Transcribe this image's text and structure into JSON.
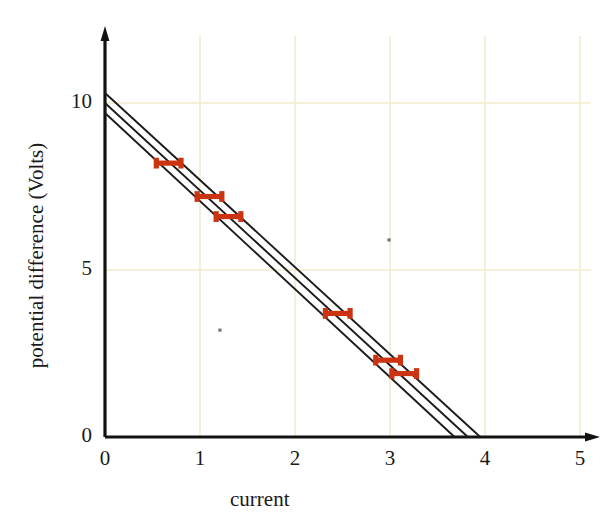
{
  "chart_data": {
    "type": "scatter",
    "title": "",
    "xlabel": "current",
    "ylabel": "potential difference (Volts)",
    "xlim": [
      0,
      5
    ],
    "ylim": [
      0,
      12
    ],
    "xticks": [
      0,
      1,
      2,
      3,
      4,
      5
    ],
    "xtick_labels": [
      "0",
      "1",
      "2",
      "3",
      "4",
      "5"
    ],
    "yticks": [
      0,
      5,
      10
    ],
    "ytick_labels": [
      "0",
      "5",
      "10"
    ],
    "grid": true,
    "grid_color": "#f2eccd",
    "axis_color": "#121212",
    "legend": "none",
    "marker_color": "#cc3311",
    "line_color": "#1c1c1c",
    "points": [
      {
        "x": 0.67,
        "y": 8.2,
        "xerr": 0.13
      },
      {
        "x": 1.1,
        "y": 7.2,
        "xerr": 0.13
      },
      {
        "x": 1.3,
        "y": 6.6,
        "xerr": 0.13
      },
      {
        "x": 2.45,
        "y": 3.7,
        "xerr": 0.13
      },
      {
        "x": 2.98,
        "y": 2.3,
        "xerr": 0.13
      },
      {
        "x": 3.15,
        "y": 1.9,
        "xerr": 0.13
      }
    ],
    "series": [
      {
        "name": "max-slope line",
        "intercept": 9.7,
        "x_intercept": 3.68,
        "slope": -2.636
      },
      {
        "name": "best-fit line",
        "intercept": 10.0,
        "x_intercept": 3.82,
        "slope": -2.618
      },
      {
        "name": "min-slope line",
        "intercept": 10.3,
        "x_intercept": 3.95,
        "slope": -2.608
      }
    ],
    "stray_marks": [
      {
        "x": 1.21,
        "y": 3.2
      },
      {
        "x": 2.99,
        "y": 5.9
      }
    ]
  },
  "axes": {
    "x_title": "current",
    "y_title": "potential difference (Volts)"
  }
}
